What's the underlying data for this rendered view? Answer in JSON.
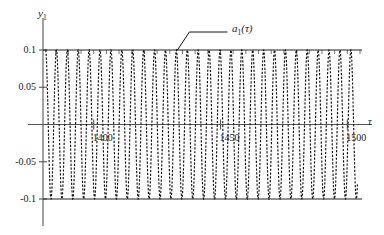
{
  "chart_data": {
    "type": "line",
    "title": "",
    "xlabel": "τ",
    "ylabel": "y",
    "ylabel_sub": "1",
    "series_label": "a",
    "series_label_sub": "1",
    "series_label_arg": "(τ)",
    "series_name": "a_1(tau)",
    "xlim": [
      1380,
      1505
    ],
    "ylim": [
      -0.115,
      0.115
    ],
    "xticks": [
      1400,
      1450,
      1500
    ],
    "xtick_labels": [
      "1400",
      "1450",
      "1500"
    ],
    "yticks": [
      0.1,
      0.05,
      0,
      -0.05,
      -0.1
    ],
    "ytick_labels": [
      "0.1",
      "0.05",
      "",
      "-0.05",
      "-0.1"
    ],
    "grid": false,
    "legend_position": "none",
    "minor_xtick_spacing": 5,
    "waveform": {
      "description": "high-frequency sinusoidal oscillation with constant amplitude envelope",
      "amplitude": 0.1,
      "period_tau": 4.3,
      "cycles_visible": 29,
      "x_start": 1381,
      "x_end": 1504,
      "envelope_upper": 0.1,
      "envelope_lower": -0.1,
      "linestyle": "dashed",
      "linewidth": 1.0
    },
    "annotations": [
      {
        "text": "a_1(tau)",
        "x_data": 1433,
        "y_data": 0.1,
        "leader": "elbow-line from curve envelope up-right to label"
      }
    ],
    "colors": {
      "curve": "#111111",
      "axis": "#555555",
      "envelope": "#222222",
      "text": "#1a1a1a",
      "background": "#ffffff"
    }
  }
}
